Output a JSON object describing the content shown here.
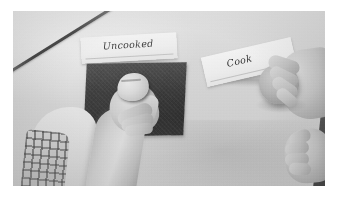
{
  "image": {
    "kind": "photograph",
    "rendering": "grayscale",
    "scene_description": "Two children's hands at a light table: one hand presses a cut potato onto a dark mat, the other holds a round potato over a card",
    "background_color": "#ffffff"
  },
  "photo": {
    "table_color": "#d6d6d3",
    "mat_color": "#3a3a37",
    "skin_color": "#d6c5b0",
    "card_color": "#f4f4f1"
  },
  "labels": {
    "card_uncooked": "Uncooked",
    "card_cooked": "Cook"
  },
  "objects": {
    "mat": "cutting-mat",
    "pencil": "pencil",
    "potato_uncooked": "potato-half-uncooked",
    "potato_cooked": "potato-whole-cooked",
    "sleeve_plaid": "plaid-sleeve",
    "sleeve_dark": "dark-sleeve",
    "left_hand": "left-hand",
    "right_hand": "right-hand",
    "fist": "fist"
  },
  "caption": ""
}
